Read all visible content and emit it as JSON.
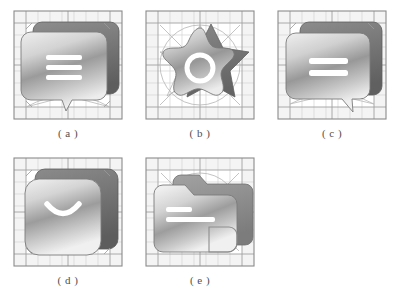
{
  "figure": {
    "style": "grayscale design-grid construction sheet",
    "panel_count": 5,
    "rows": 2,
    "columns": 3,
    "colors": {
      "background": "#ffffff",
      "grid_outer_border": "#8e8e8e",
      "grid_line_major": "#a3a3a3",
      "grid_line_minor": "#c9c9c9",
      "construction_guide": "#b5b5b5",
      "margin_band": "#f1f1f1",
      "icon_gradient_light": "#f2f2f2",
      "icon_gradient_mid": "#a9a9a9",
      "icon_gradient_dark": "#7d7d7d",
      "icon_shadow_dark": "#6e6e6e",
      "icon_outline": "#7a7a7a",
      "glyph_white": "#ffffff",
      "caption_text": "#4f4f4f"
    }
  },
  "panels": [
    {
      "id": "a",
      "caption": "( a )",
      "icon_name": "speech-bubble-menu-icon",
      "icon_description": "Rounded speech bubble with three horizontal menu lines and a downward tail",
      "glyph": "three-horizontal-lines",
      "glyph_count": 3,
      "has_shadow_copy": true,
      "shadow_offset": {
        "x": 12,
        "y": -10
      },
      "construction_guides": [
        "grid",
        "bottom-arc",
        "diagonals"
      ]
    },
    {
      "id": "b",
      "caption": "( b )",
      "icon_name": "star-burst-ring-icon",
      "icon_description": "Five pointed rounded star burst with a white ring in the centre",
      "glyph": "ring",
      "glyph_count": 1,
      "has_shadow_copy": true,
      "shadow_offset": {
        "x": 14,
        "y": -6
      },
      "construction_guides": [
        "grid",
        "circle",
        "pentagram-diagonals"
      ]
    },
    {
      "id": "c",
      "caption": "( c )",
      "icon_name": "speech-bubble-equals-icon",
      "icon_description": "Rounded speech bubble with two horizontal lines and a tail at the lower right",
      "glyph": "two-horizontal-lines",
      "glyph_count": 2,
      "has_shadow_copy": true,
      "shadow_offset": {
        "x": 14,
        "y": -10
      },
      "construction_guides": [
        "grid",
        "bottom-arc",
        "diagonals"
      ]
    },
    {
      "id": "d",
      "caption": "( d )",
      "icon_name": "rounded-square-smile-icon",
      "icon_description": "Rounded square tile with a white smile curve",
      "glyph": "smile-curve",
      "glyph_count": 1,
      "has_shadow_copy": true,
      "shadow_offset": {
        "x": 14,
        "y": -10
      },
      "construction_guides": [
        "grid",
        "corner-marks"
      ]
    },
    {
      "id": "e",
      "caption": "( e )",
      "icon_name": "folder-lines-icon",
      "icon_description": "Folder with raised tab, two white horizontal lines and a rounded notch at the lower right",
      "glyph": "two-horizontal-lines",
      "glyph_count": 2,
      "has_shadow_copy": true,
      "shadow_offset": {
        "x": 14,
        "y": -10
      },
      "construction_guides": [
        "grid",
        "circle",
        "diagonals"
      ]
    }
  ]
}
